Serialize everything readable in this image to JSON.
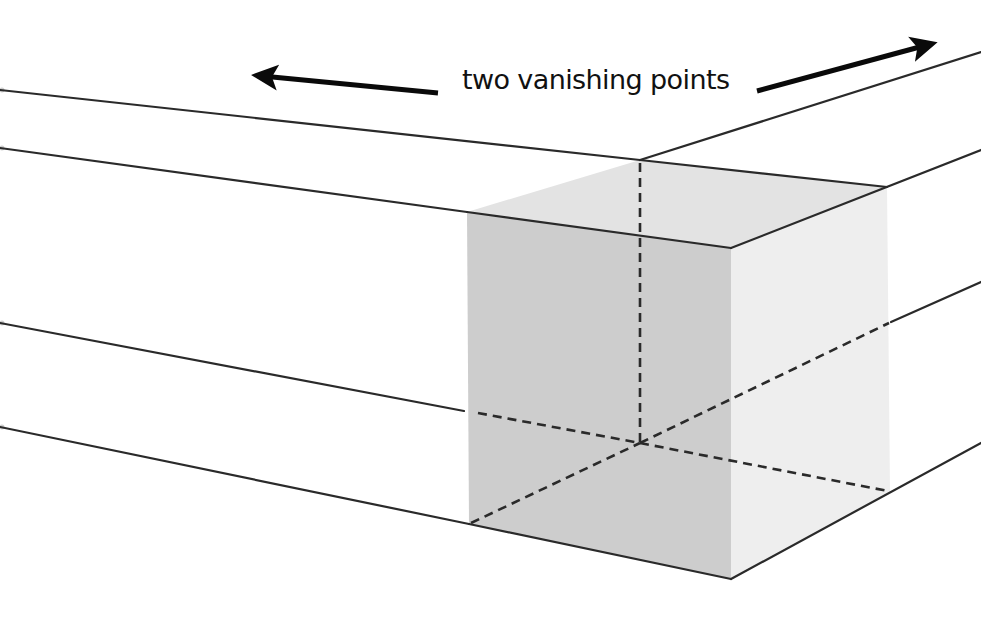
{
  "diagram": {
    "label": "two vanishing points",
    "colors": {
      "background": "#ffffff",
      "line": "#2a2a2a",
      "arrow": "#0a0a0a",
      "face_left": "#cdcdcd",
      "face_top": "#e3e3e3",
      "face_right": "#eeeeee"
    },
    "arrows": [
      {
        "name": "left-vanishing-arrow",
        "direction": "left",
        "from": [
          438,
          93
        ],
        "to": [
          252,
          75
        ]
      },
      {
        "name": "right-vanishing-arrow",
        "direction": "right",
        "from": [
          757,
          91
        ],
        "to": [
          937,
          42
        ]
      }
    ],
    "cube_vertices": {
      "top_back": [
        640,
        160
      ],
      "top_left": [
        467,
        212
      ],
      "top_front": [
        731,
        248
      ],
      "top_right": [
        887,
        187
      ],
      "bottom_back_hidden": [
        640,
        443
      ],
      "bottom_left": [
        469,
        524
      ],
      "bottom_front": [
        731,
        579
      ],
      "bottom_right": [
        890,
        492
      ]
    },
    "convergence_lines_left": [
      {
        "from": [
          0,
          90
        ],
        "to": [
          640,
          160
        ]
      },
      {
        "from": [
          0,
          148
        ],
        "to": [
          467,
          212
        ]
      },
      {
        "from": [
          0,
          323
        ],
        "to": [
          464,
          411
        ]
      },
      {
        "from": [
          0,
          427
        ],
        "to": [
          469,
          524
        ]
      }
    ],
    "convergence_lines_right": [
      {
        "from": [
          640,
          160
        ],
        "to": [
          981,
          52
        ]
      },
      {
        "from": [
          887,
          187
        ],
        "to": [
          981,
          150
        ]
      },
      {
        "from": [
          891,
          322
        ],
        "to": [
          981,
          282
        ]
      },
      {
        "from": [
          890,
          492
        ],
        "to": [
          981,
          443
        ]
      }
    ],
    "hidden_edges": [
      {
        "from": [
          640,
          160
        ],
        "to": [
          640,
          443
        ]
      },
      {
        "from": [
          478,
          413
        ],
        "to": [
          640,
          443
        ]
      },
      {
        "from": [
          469,
          524
        ],
        "to": [
          640,
          443
        ]
      },
      {
        "from": [
          640,
          443
        ],
        "to": [
          891,
          322
        ]
      },
      {
        "from": [
          640,
          443
        ],
        "to": [
          890,
          492
        ]
      }
    ]
  }
}
